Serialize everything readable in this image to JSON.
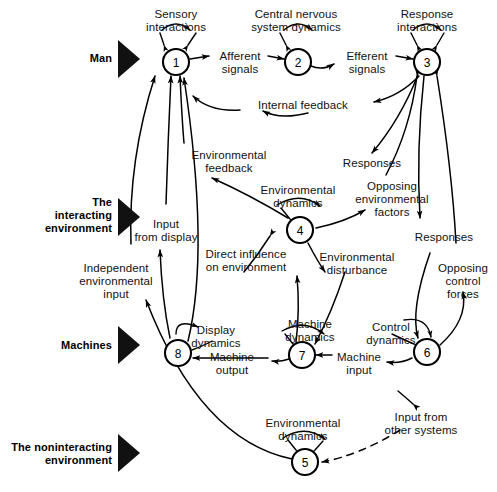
{
  "figure": {
    "type": "systems-block-diagram",
    "background": "#ffffff",
    "ink": "#000000",
    "width": 497,
    "height": 492
  },
  "bands": [
    {
      "id": "man",
      "label": "Man",
      "x": 78,
      "y": 57,
      "marker_x": 124,
      "marker_y": 50
    },
    {
      "id": "interacting",
      "label": "The\ninteracting\nenvironment",
      "x": 36,
      "y": 208,
      "marker_x": 124,
      "marker_y": 210
    },
    {
      "id": "machines",
      "label": "Machines",
      "x": 45,
      "y": 345,
      "marker_x": 124,
      "marker_y": 338
    },
    {
      "id": "noninteracting",
      "label": "The noninteracting\nenvironment",
      "x": 12,
      "y": 447,
      "marker_x": 124,
      "marker_y": 446
    }
  ],
  "nodes": [
    {
      "id": "n1",
      "number": "1",
      "cx": 176,
      "cy": 62,
      "r": 13,
      "self_label": "Sensory\ninteractions"
    },
    {
      "id": "n2",
      "number": "2",
      "cx": 298,
      "cy": 62,
      "r": 13,
      "self_label": "Central nervous\nsystem dynamics"
    },
    {
      "id": "n3",
      "number": "3",
      "cx": 427,
      "cy": 62,
      "r": 13,
      "self_label": "Response\ninteractions"
    },
    {
      "id": "n4",
      "number": "4",
      "cx": 300,
      "cy": 230,
      "r": 13,
      "self_label": "Environmental\ndynamics"
    },
    {
      "id": "n5",
      "number": "5",
      "cx": 305,
      "cy": 462,
      "r": 13,
      "self_label": "Environmental\ndynamics"
    },
    {
      "id": "n6",
      "number": "6",
      "cx": 427,
      "cy": 352,
      "r": 13,
      "self_label": "Control\ndynamics"
    },
    {
      "id": "n7",
      "number": "7",
      "cx": 302,
      "cy": 355,
      "r": 13,
      "self_label": "Machine\ndynamics"
    },
    {
      "id": "n8",
      "number": "8",
      "cx": 178,
      "cy": 353,
      "r": 13,
      "self_label": "Display\ndynamics"
    }
  ],
  "edge_labels": [
    {
      "id": "sensory-interactions",
      "text": "Sensory\ninteractions",
      "x": 176,
      "y": 11
    },
    {
      "id": "central-nervous-system-dynamics",
      "text": "Central nervous\nsystem dynamics",
      "x": 296,
      "y": 11
    },
    {
      "id": "response-interactions",
      "text": "Response\ninteractions",
      "x": 427,
      "y": 11
    },
    {
      "id": "afferent-signals",
      "text": "Afferent\nsignals",
      "x": 239,
      "y": 54
    },
    {
      "id": "efferent-signals",
      "text": "Efferent\nsignals",
      "x": 366,
      "y": 54
    },
    {
      "id": "internal-feedback",
      "text": "Internal feedback",
      "x": 303,
      "y": 104
    },
    {
      "id": "environmental-feedback",
      "text": "Environmental\nfeedback",
      "x": 228,
      "y": 156
    },
    {
      "id": "environmental-dynamics-4",
      "text": "Environmental\ndynamics",
      "x": 298,
      "y": 189
    },
    {
      "id": "responses-upper",
      "text": "Responses",
      "x": 372,
      "y": 163
    },
    {
      "id": "opposing-environmental-factors",
      "text": "Opposing\nenvironmental\nfactors",
      "x": 392,
      "y": 186
    },
    {
      "id": "input-from-display",
      "text": "Input\nfrom display",
      "x": 166,
      "y": 224
    },
    {
      "id": "direct-influence-on-environment",
      "text": "Direct influence\non environment",
      "x": 246,
      "y": 254
    },
    {
      "id": "environmental-disturbance",
      "text": "Environmental\ndisturbance",
      "x": 357,
      "y": 257
    },
    {
      "id": "responses-lower",
      "text": "Responses",
      "x": 444,
      "y": 237
    },
    {
      "id": "independent-environmental-input",
      "text": "Independent\nenvironmental\ninput",
      "x": 116,
      "y": 272
    },
    {
      "id": "opposing-control-forces",
      "text": "Opposing\ncontrol\nforces",
      "x": 465,
      "y": 268
    },
    {
      "id": "display-dynamics",
      "text": "Display\ndynamics",
      "x": 216,
      "y": 330
    },
    {
      "id": "machine-dynamics",
      "text": "Machine\ndynamics",
      "x": 310,
      "y": 324
    },
    {
      "id": "control-dynamics",
      "text": "Control\ndynamics",
      "x": 391,
      "y": 327
    },
    {
      "id": "machine-output",
      "text": "Machine\noutput",
      "x": 232,
      "y": 357
    },
    {
      "id": "machine-input",
      "text": "Machine\ninput",
      "x": 359,
      "y": 357
    },
    {
      "id": "input-from-other-systems",
      "text": "Input from\nother systems",
      "x": 421,
      "y": 417
    },
    {
      "id": "environmental-dynamics-5",
      "text": "Environmental\ndynamics",
      "x": 303,
      "y": 423
    }
  ],
  "edges": [
    {
      "id": "n1-to-n2",
      "from": "n1",
      "to": "n2",
      "label": "afferent-signals",
      "style": "solid"
    },
    {
      "id": "n2-to-n3",
      "from": "n2",
      "to": "n3",
      "label": "efferent-signals",
      "style": "solid"
    },
    {
      "id": "n3-to-n1",
      "from": "n3",
      "to": "n1",
      "label": "internal-feedback",
      "style": "solid"
    },
    {
      "id": "n4-to-n1",
      "from": "n4",
      "to": "n1",
      "label": "environmental-feedback",
      "style": "solid"
    },
    {
      "id": "n3-to-n4",
      "from": "n3",
      "to": "n4",
      "label": "responses-upper",
      "style": "solid"
    },
    {
      "id": "n4-to-n3",
      "from": "n4",
      "to": "n3",
      "label": "opposing-environmental-factors",
      "style": "solid"
    },
    {
      "id": "n8-to-n1",
      "from": "n8",
      "to": "n1",
      "label": "input-from-display",
      "style": "solid"
    },
    {
      "id": "n7-to-n4",
      "from": "n7",
      "to": "n4",
      "label": "direct-influence-on-environment",
      "style": "solid"
    },
    {
      "id": "n4-to-n7",
      "from": "n4",
      "to": "n7",
      "label": "environmental-disturbance",
      "style": "solid"
    },
    {
      "id": "n3-to-n6",
      "from": "n3",
      "to": "n6",
      "label": "responses-lower",
      "style": "solid"
    },
    {
      "id": "n6-to-n3",
      "from": "n6",
      "to": "n3",
      "label": "opposing-control-forces",
      "style": "solid"
    },
    {
      "id": "n7-to-n8",
      "from": "n7",
      "to": "n8",
      "label": "machine-output",
      "style": "solid"
    },
    {
      "id": "n6-to-n7",
      "from": "n6",
      "to": "n7",
      "label": "machine-input",
      "style": "solid"
    },
    {
      "id": "n5-to-n1",
      "from": "n5",
      "to": "n1",
      "label": "independent-environmental-input",
      "style": "solid"
    },
    {
      "id": "other-to-n5",
      "from": "other-systems",
      "to": "n5",
      "label": "input-from-other-systems",
      "style": "dashed"
    }
  ]
}
